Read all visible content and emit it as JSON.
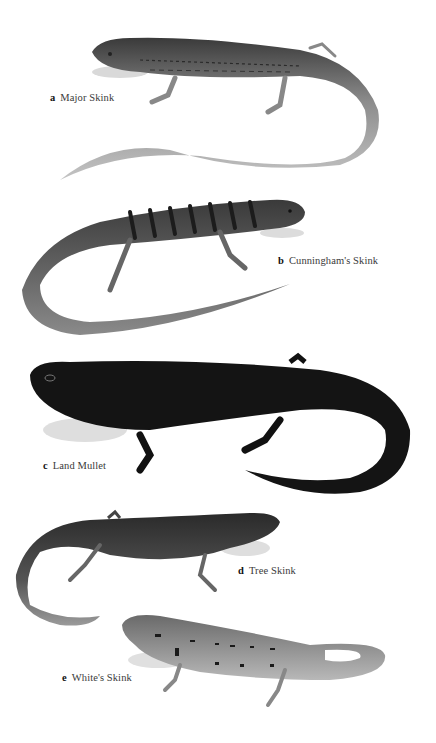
{
  "plate": {
    "background": "#ffffff",
    "specimens": [
      {
        "letter": "a",
        "name": "Major Skink",
        "tone": "#8a8a8a",
        "dark": "#3c3c3c"
      },
      {
        "letter": "b",
        "name": "Cunningham's Skink",
        "tone": "#6e6e6e",
        "dark": "#2a2a2a"
      },
      {
        "letter": "c",
        "name": "Land Mullet",
        "tone": "#151515",
        "dark": "#050505"
      },
      {
        "letter": "d",
        "name": "Tree Skink",
        "tone": "#4a4a4a",
        "dark": "#1e1e1e"
      },
      {
        "letter": "e",
        "name": "White's Skink",
        "tone": "#9a9a9a",
        "dark": "#2e2e2e"
      }
    ]
  }
}
